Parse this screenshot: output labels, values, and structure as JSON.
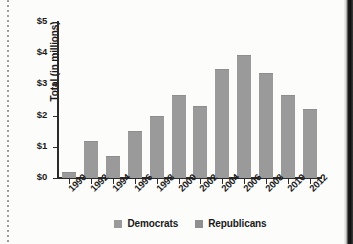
{
  "chart_data": {
    "type": "bar",
    "title": "",
    "subtitle": "",
    "xlabel": "",
    "ylabel": "Total (in millions)",
    "categories": [
      "1990",
      "1992",
      "1994",
      "1996",
      "1998",
      "2000",
      "2002",
      "2004",
      "2006",
      "2008",
      "2010",
      "2012"
    ],
    "values": [
      0.2,
      1.2,
      0.7,
      1.5,
      2.0,
      2.65,
      2.3,
      3.5,
      3.95,
      3.35,
      2.65,
      2.2
    ],
    "series": [
      {
        "name": "Total",
        "values": [
          0.2,
          1.2,
          0.7,
          1.5,
          2.0,
          2.65,
          2.3,
          3.5,
          3.95,
          3.35,
          2.65,
          2.2
        ]
      }
    ],
    "ylim": [
      0,
      5
    ],
    "ytick_values": [
      0,
      1,
      2,
      3,
      4,
      5
    ],
    "ytick_labels": [
      "$0",
      "$1",
      "$2",
      "$3",
      "$4",
      "$5"
    ],
    "grid": false,
    "legend_position": "bottom",
    "legend": [
      "Democrats",
      "Republicans"
    ],
    "bar_color": "#9a9a9a",
    "axis_color": "#2b2b2b"
  },
  "legend": {
    "items": [
      {
        "label": "Democrats",
        "color": "#9a9a9a"
      },
      {
        "label": "Republicans",
        "color": "#8f8f8f"
      }
    ]
  },
  "axes": {
    "y_title": "Total (in millions)"
  }
}
